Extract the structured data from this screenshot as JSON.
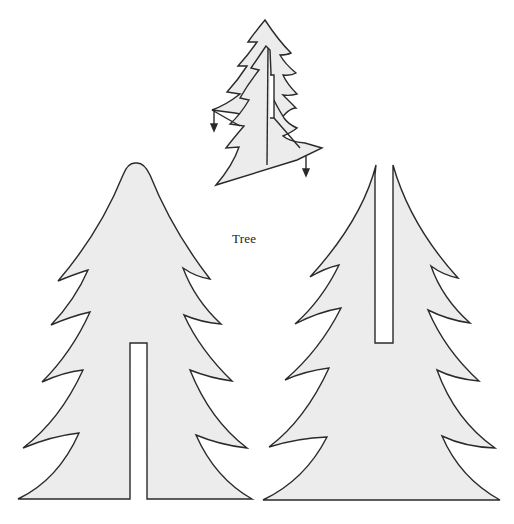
{
  "caption": "Tree",
  "colors": {
    "background": "#ffffff",
    "fill": "#ececec",
    "stroke": "#2a2a2a"
  },
  "pieces": [
    {
      "name": "tree-piece-with-bottom-slot",
      "slot": "bottom"
    },
    {
      "name": "tree-piece-with-top-slot",
      "slot": "top"
    }
  ],
  "assembly_illustration": {
    "description": "Two tree pieces slotted together at right angles",
    "arrows": 2
  }
}
